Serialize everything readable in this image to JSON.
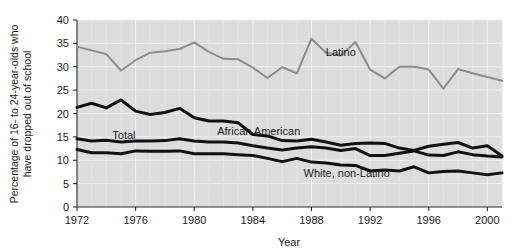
{
  "chart_data": {
    "type": "line",
    "title": "",
    "xlabel": "Year",
    "ylabel": "Percentage of 16- to 24-year-olds who have dropped out of school",
    "ylabel_line1": "Percentage of 16- to 24-year-olds who",
    "ylabel_line2": "have dropped out of school",
    "xlim": [
      1972,
      2001
    ],
    "ylim": [
      0,
      40
    ],
    "yticks": [
      0,
      5,
      10,
      15,
      20,
      25,
      30,
      35,
      40
    ],
    "ytick_labels": [
      "0",
      "5",
      "10",
      "15",
      "20",
      "25",
      "30",
      "35",
      "40"
    ],
    "xticks": [
      1972,
      1976,
      1980,
      1984,
      1988,
      1992,
      1996,
      2000
    ],
    "xtick_labels": [
      "1972",
      "1976",
      "1980",
      "1984",
      "1988",
      "1992",
      "1996",
      "2000"
    ],
    "grid": true,
    "grid_style": "light vertical and horizontal lines on gray plot background",
    "legend_position": "inline labels on plot",
    "plot_background": "#dcdcdc",
    "x": [
      1972,
      1973,
      1974,
      1975,
      1976,
      1977,
      1978,
      1979,
      1980,
      1981,
      1982,
      1983,
      1984,
      1985,
      1986,
      1987,
      1988,
      1989,
      1990,
      1991,
      1992,
      1993,
      1994,
      1995,
      1996,
      1997,
      1998,
      1999,
      2000,
      2001
    ],
    "series": [
      {
        "name": "Latino",
        "label": "Latino",
        "color": "#8c8c8c",
        "line_width": 2,
        "values": [
          34.3,
          33.5,
          32.7,
          29.2,
          31.4,
          33.0,
          33.3,
          33.8,
          35.2,
          33.2,
          31.7,
          31.6,
          29.8,
          27.6,
          29.9,
          28.6,
          36.0,
          33.0,
          32.4,
          35.3,
          29.4,
          27.5,
          30.0,
          30.0,
          29.4,
          25.3,
          29.5,
          28.6,
          27.8,
          27.0
        ]
      },
      {
        "name": "African American",
        "label": "African American",
        "color": "#111111",
        "line_width": 3,
        "values": [
          21.3,
          22.2,
          21.2,
          22.9,
          20.5,
          19.8,
          20.2,
          21.1,
          19.1,
          18.4,
          18.4,
          18.0,
          15.5,
          15.2,
          14.2,
          14.1,
          14.5,
          13.9,
          13.2,
          13.6,
          13.7,
          13.6,
          12.6,
          12.1,
          13.0,
          13.4,
          13.8,
          12.6,
          13.1,
          10.9
        ]
      },
      {
        "name": "Total",
        "label": "Total",
        "color": "#111111",
        "line_width": 3,
        "values": [
          14.6,
          14.1,
          14.3,
          13.9,
          14.1,
          14.1,
          14.2,
          14.6,
          14.1,
          13.9,
          13.9,
          13.7,
          13.1,
          12.6,
          12.2,
          12.6,
          12.9,
          12.6,
          12.1,
          12.5,
          11.0,
          11.0,
          11.5,
          12.0,
          11.1,
          11.0,
          11.8,
          11.2,
          10.9,
          10.7
        ]
      },
      {
        "name": "White, non-Latino",
        "label": "White, non-Latino",
        "color": "#111111",
        "line_width": 3,
        "values": [
          12.3,
          11.6,
          11.6,
          11.4,
          12.0,
          11.9,
          11.9,
          12.0,
          11.4,
          11.4,
          11.4,
          11.2,
          11.0,
          10.4,
          9.7,
          10.4,
          9.6,
          9.4,
          9.0,
          8.9,
          7.7,
          7.9,
          7.7,
          8.6,
          7.3,
          7.6,
          7.7,
          7.3,
          6.9,
          7.3
        ]
      }
    ],
    "annotations": [
      {
        "text": "Latino",
        "x": 1990,
        "y": 32.2
      },
      {
        "text": "African American",
        "x": 1984.4,
        "y": 15.4
      },
      {
        "text": "Total",
        "x": 1975.2,
        "y": 14.6
      },
      {
        "text": "White, non-Latino",
        "x": 1990.4,
        "y": 6.4
      }
    ]
  }
}
